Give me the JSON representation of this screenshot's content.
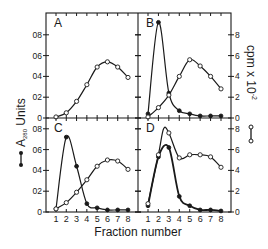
{
  "chart_data": {
    "type": "line",
    "title": "",
    "xlabel": "Fraction number",
    "ylabel_left": "A280 Units",
    "ylabel_left_main": "A",
    "ylabel_left_sub": "280",
    "ylabel_left_tail": " Units",
    "ylabel_right": "cpm x 10^-2",
    "ylabel_right_main": "cpm x 10",
    "ylabel_right_sup": "-2",
    "x_ticks": [
      1,
      2,
      3,
      4,
      5,
      6,
      7,
      8
    ],
    "y_left_ticks": [
      "0",
      "0.2",
      "0.4",
      "0.6",
      "0.8"
    ],
    "y_left_tick_labels": [
      "0",
      "02",
      "04",
      "06",
      "08"
    ],
    "y_right_ticks": [
      "0",
      "2",
      "4",
      "6",
      "8"
    ],
    "ylim_left": [
      0,
      1.0
    ],
    "ylim_right": [
      0,
      10
    ],
    "legend": [
      {
        "marker": "filled-circle",
        "label": "A280 Units"
      },
      {
        "marker": "open-circle",
        "label": "cpm x 10^-2"
      }
    ],
    "panels": [
      {
        "label": "A",
        "series": [
          {
            "name": "cpm x 10^-2",
            "marker": "open",
            "x": [
              1,
              2,
              3,
              4,
              5,
              6,
              7,
              8
            ],
            "values": [
              0.1,
              0.5,
              1.6,
              3.2,
              4.9,
              5.4,
              4.9,
              3.9
            ]
          }
        ]
      },
      {
        "label": "B",
        "series": [
          {
            "name": "A280 Units",
            "marker": "filled",
            "x": [
              1,
              2,
              3,
              4,
              5,
              6,
              7,
              8
            ],
            "values": [
              0.04,
              0.92,
              0.24,
              0.07,
              0.04,
              0.02,
              0.02,
              0.02
            ]
          },
          {
            "name": "cpm x 10^-2",
            "marker": "open",
            "x": [
              1,
              2,
              3,
              4,
              5,
              6,
              7,
              8
            ],
            "values": [
              0.1,
              1.0,
              2.2,
              4.0,
              5.6,
              5.0,
              4.0,
              2.8
            ]
          }
        ]
      },
      {
        "label": "C",
        "series": [
          {
            "name": "A280 Units",
            "marker": "filled",
            "x": [
              1,
              2,
              3,
              4,
              5,
              6,
              7,
              8
            ],
            "values": [
              0.03,
              0.72,
              0.44,
              0.08,
              0.04,
              0.02,
              0.02,
              0.02
            ]
          },
          {
            "name": "cpm x 10^-2",
            "marker": "open",
            "x": [
              1,
              2,
              3,
              4,
              5,
              6,
              7,
              8
            ],
            "values": [
              0.3,
              0.9,
              1.9,
              3.1,
              4.4,
              5.0,
              4.9,
              4.1
            ]
          }
        ]
      },
      {
        "label": "D",
        "series": [
          {
            "name": "A280 Units",
            "marker": "filled",
            "x": [
              1,
              2,
              3,
              4,
              5,
              6,
              7,
              8
            ],
            "values": [
              0.06,
              0.53,
              0.62,
              0.15,
              0.06,
              0.02,
              0.02,
              0.01
            ]
          },
          {
            "name": "cpm x 10^-2",
            "marker": "open",
            "x": [
              1,
              2,
              2.5,
              3,
              4,
              5,
              6,
              7,
              8
            ],
            "values": [
              0.8,
              5.5,
              8.0,
              7.6,
              5.2,
              5.5,
              5.5,
              5.3,
              4.3
            ]
          }
        ]
      }
    ]
  }
}
